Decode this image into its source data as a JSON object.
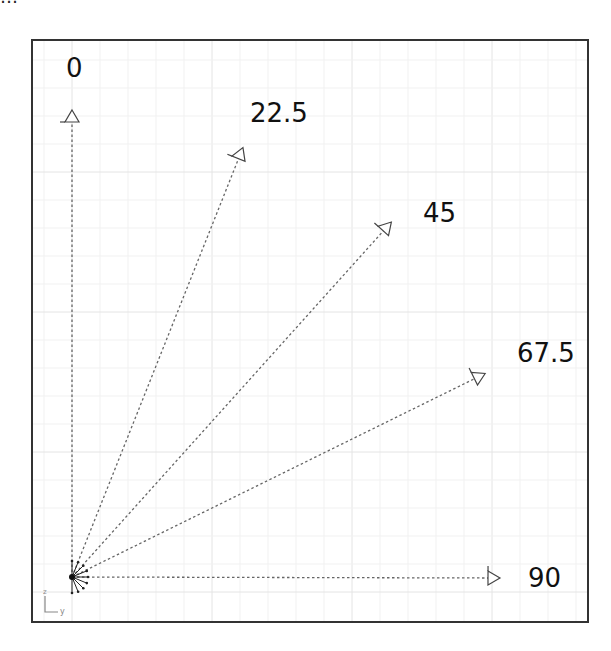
{
  "clipped_caption": "…",
  "frame": {
    "left": 32,
    "top": 40,
    "right": 588,
    "bottom": 622,
    "stroke": "#333333"
  },
  "grid": {
    "major_spacing": 140,
    "minor_spacing": 28,
    "origin_x": 72,
    "origin_y": 592,
    "major_color": "#e4e4e4",
    "minor_color": "#f1f1f1"
  },
  "origin": {
    "x": 72,
    "y": 577
  },
  "axis_glyph": {
    "z_label": "z",
    "y_label": "y"
  },
  "vectors": [
    {
      "label": "0",
      "angle_deg": 0,
      "end_x": 72,
      "end_y": 118,
      "label_x": 66,
      "label_y": 55
    },
    {
      "label": "22.5",
      "angle_deg": 22.5,
      "end_x": 240,
      "end_y": 155,
      "label_x": 250,
      "label_y": 100
    },
    {
      "label": "45",
      "angle_deg": 45,
      "end_x": 386,
      "end_y": 228,
      "label_x": 423,
      "label_y": 200
    },
    {
      "label": "67.5",
      "angle_deg": 67.5,
      "end_x": 478,
      "end_y": 377,
      "label_x": 517,
      "label_y": 340
    },
    {
      "label": "90",
      "angle_deg": 90,
      "end_x": 492,
      "end_y": 578,
      "label_x": 528,
      "label_y": 565
    }
  ],
  "line_color": "#666666"
}
